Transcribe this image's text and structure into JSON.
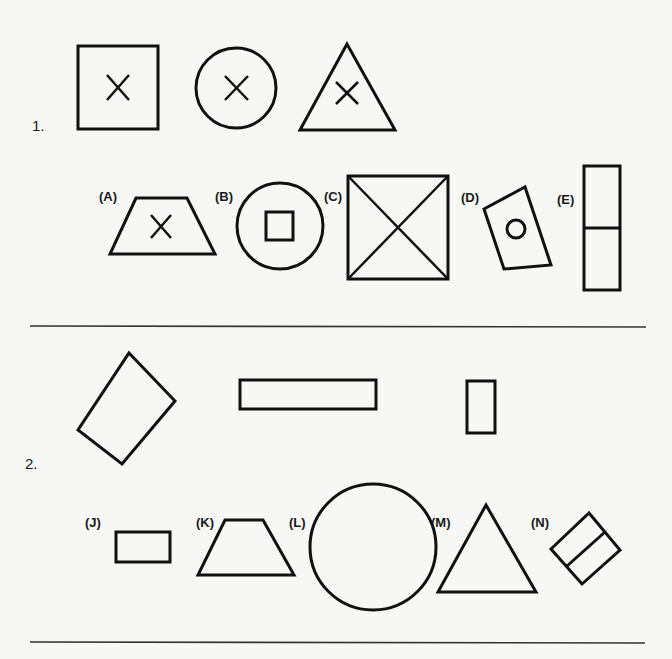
{
  "questions": [
    {
      "number": "1.",
      "prompt_figures": [
        "square-with-x",
        "circle-with-x",
        "triangle-with-x"
      ],
      "options": [
        {
          "label": "(A)",
          "figure": "trapezoid-with-x"
        },
        {
          "label": "(B)",
          "figure": "circle-with-square"
        },
        {
          "label": "(C)",
          "figure": "square-with-diagonals"
        },
        {
          "label": "(D)",
          "figure": "tilted-rectangle-with-circle"
        },
        {
          "label": "(E)",
          "figure": "tall-rectangle-divided"
        }
      ]
    },
    {
      "number": "2.",
      "prompt_figures": [
        "tilted-rectangle",
        "wide-rectangle",
        "small-tall-rectangle"
      ],
      "options": [
        {
          "label": "(J)",
          "figure": "small-rectangle"
        },
        {
          "label": "(K)",
          "figure": "trapezoid"
        },
        {
          "label": "(L)",
          "figure": "circle"
        },
        {
          "label": "(M)",
          "figure": "triangle"
        },
        {
          "label": "(N)",
          "figure": "tilted-divided-rectangle"
        }
      ]
    }
  ],
  "colors": {
    "stroke": "#111111",
    "background": "#f7f7f6",
    "divider": "#333333"
  }
}
